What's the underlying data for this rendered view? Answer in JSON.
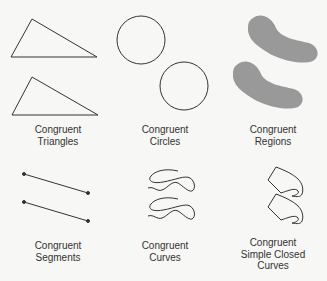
{
  "diagram": {
    "panels": [
      {
        "id": "triangles",
        "caption": [
          "Congruent",
          "Triangles"
        ]
      },
      {
        "id": "circles",
        "caption": [
          "Congruent",
          "Circles"
        ]
      },
      {
        "id": "regions",
        "caption": [
          "Congruent",
          "Regions"
        ]
      },
      {
        "id": "segments",
        "caption": [
          "Congruent",
          "Segments"
        ]
      },
      {
        "id": "curves",
        "caption": [
          "Congruent",
          "Curves"
        ]
      },
      {
        "id": "closed-curves",
        "caption": [
          "Congruent",
          "Simple Closed",
          "Curves"
        ]
      }
    ],
    "colors": {
      "stroke": "#333333",
      "region_fill": "#999999",
      "background": "#f7f7f5"
    }
  }
}
